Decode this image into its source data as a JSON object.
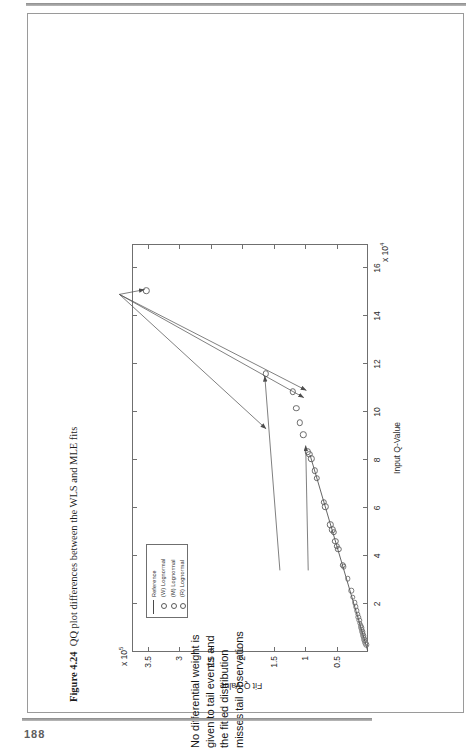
{
  "page": {
    "folio": "188"
  },
  "figure": {
    "caption_label": "Figure 4.24",
    "caption_text": "QQ plot differences between the WLS and MLE fits"
  },
  "annotations": [
    {
      "id": "left-note",
      "text": "No differential weight is given to tail events and the fitted distribution misses tail observations"
    },
    {
      "id": "right-note",
      "text": "By focusing the fit into the tail observations, the probability weighted least squares fits a distribution which closer replicates these observations"
    }
  ],
  "legend": {
    "items": [
      {
        "label": "Reference",
        "marker": "line"
      },
      {
        "label": "(W) Lognormal",
        "marker": "circle"
      },
      {
        "label": "(M) Lognormal",
        "marker": "circle"
      },
      {
        "label": "(R) Lognormal",
        "marker": "circle"
      }
    ]
  },
  "chart_data": {
    "type": "scatter",
    "title": "",
    "xlabel": "Input Q-Value",
    "ylabel": "Fit Q-Value",
    "x_exponent": "x 10",
    "x_exponent_sup": "4",
    "y_exponent": "x 10",
    "y_exponent_sup": "5",
    "xlim": [
      0,
      17
    ],
    "ylim": [
      0,
      3.75
    ],
    "xticks": [
      2,
      4,
      6,
      8,
      10,
      12,
      14,
      16
    ],
    "xticklabels": [
      "2",
      "4",
      "6",
      "8",
      "10",
      "12",
      "14",
      "16"
    ],
    "yticks": [
      0.5,
      1,
      1.5,
      2,
      2.5,
      3,
      3.5
    ],
    "yticklabels": [
      "0.5",
      "1",
      "1.5",
      "2",
      "2.5",
      "3",
      "3.5"
    ],
    "grid": false,
    "legend_position": "upper-left",
    "series": [
      {
        "name": "Reference",
        "type": "line",
        "points": [
          [
            0.05,
            0.005
          ],
          [
            8.2,
            0.92
          ]
        ]
      },
      {
        "name": "Scatter observations",
        "type": "scatter",
        "points": [
          [
            0.3,
            0.03
          ],
          [
            0.38,
            0.04
          ],
          [
            0.45,
            0.048
          ],
          [
            0.52,
            0.056
          ],
          [
            0.6,
            0.064
          ],
          [
            0.68,
            0.072
          ],
          [
            0.76,
            0.081
          ],
          [
            0.85,
            0.09
          ],
          [
            0.93,
            0.098
          ],
          [
            1.02,
            0.108
          ],
          [
            1.1,
            0.118
          ],
          [
            1.2,
            0.128
          ],
          [
            1.32,
            0.14
          ],
          [
            1.45,
            0.152
          ],
          [
            1.58,
            0.166
          ],
          [
            1.72,
            0.18
          ],
          [
            1.88,
            0.196
          ],
          [
            2.05,
            0.214
          ],
          [
            2.28,
            0.238
          ],
          [
            2.55,
            0.266
          ],
          [
            3.05,
            0.32
          ],
          [
            3.55,
            0.382
          ],
          [
            3.62,
            0.4
          ],
          [
            4.28,
            0.47
          ],
          [
            4.4,
            0.492
          ],
          [
            4.62,
            0.52
          ],
          [
            5.0,
            0.545
          ],
          [
            5.1,
            0.57
          ],
          [
            5.3,
            0.6
          ],
          [
            6.05,
            0.676
          ],
          [
            6.25,
            0.7
          ],
          [
            7.25,
            0.815
          ],
          [
            7.55,
            0.845
          ],
          [
            8.05,
            0.9
          ],
          [
            8.25,
            0.93
          ],
          [
            8.35,
            0.955
          ],
          [
            9.05,
            1.03
          ],
          [
            9.55,
            1.08
          ],
          [
            10.15,
            1.14
          ],
          [
            10.85,
            1.19
          ],
          [
            11.6,
            1.62
          ],
          [
            15.05,
            3.52
          ]
        ]
      }
    ],
    "arrows": [
      {
        "from": [
          14.9,
          3.95
        ],
        "to": [
          15.1,
          3.55
        ]
      },
      {
        "from": [
          14.9,
          3.95
        ],
        "to": [
          9.3,
          1.62
        ]
      },
      {
        "from": [
          14.9,
          3.95
        ],
        "to": [
          10.6,
          1.02
        ]
      },
      {
        "from": [
          14.9,
          3.95
        ],
        "to": [
          10.9,
          0.98
        ]
      },
      {
        "from": [
          3.4,
          1.4
        ],
        "to": [
          11.5,
          1.64
        ]
      },
      {
        "from": [
          3.4,
          0.95
        ],
        "to": [
          8.6,
          0.99
        ]
      }
    ]
  }
}
